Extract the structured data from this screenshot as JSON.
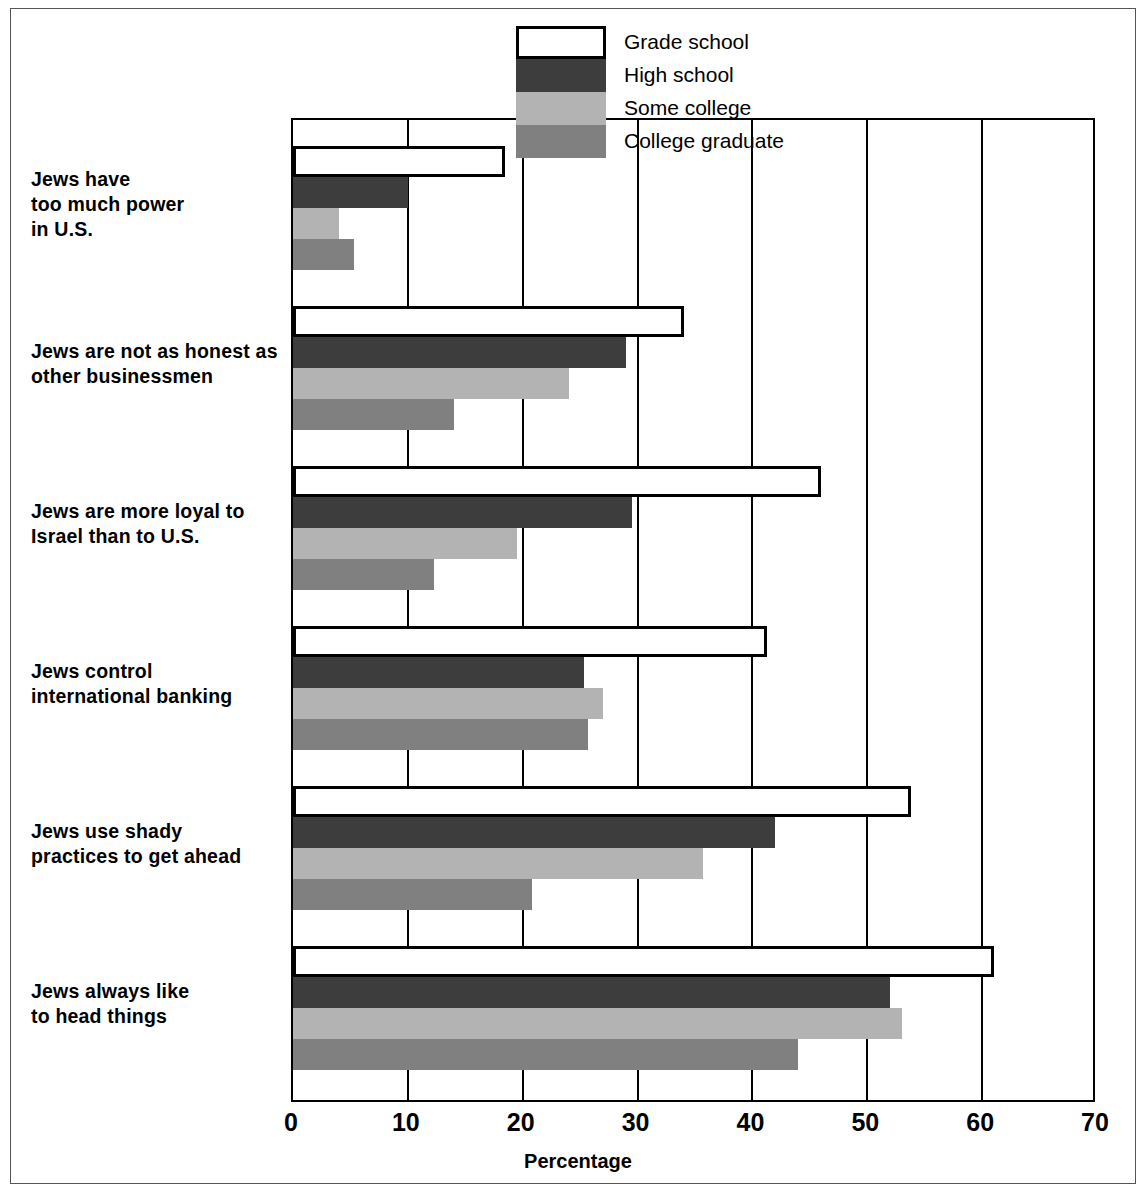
{
  "chart_data": {
    "type": "bar",
    "orientation": "horizontal",
    "title": "",
    "xlabel": "Percentage",
    "ylabel": "",
    "xlim": [
      0,
      70
    ],
    "xticks": [
      0,
      10,
      20,
      30,
      40,
      50,
      60,
      70
    ],
    "grid": true,
    "legend_position": "top-right",
    "categories": [
      "Jews have\ntoo much power\nin U.S.",
      "Jews are not as honest as\nother businessmen",
      "Jews are more loyal to\nIsrael than to U.S.",
      "Jews control\ninternational banking",
      "Jews use shady\npractices to get ahead",
      "Jews always like\nto head things"
    ],
    "series": [
      {
        "name": "Grade school",
        "color": "#ffffff",
        "values": [
          18.5,
          34.0,
          46.0,
          41.3,
          53.8,
          61.0
        ]
      },
      {
        "name": "High school",
        "color": "#3d3d3d",
        "values": [
          10.0,
          29.0,
          29.5,
          25.3,
          42.0,
          52.0
        ]
      },
      {
        "name": "Some college",
        "color": "#b3b3b3",
        "values": [
          4.0,
          24.0,
          19.5,
          27.0,
          35.7,
          53.0
        ]
      },
      {
        "name": "College graduate",
        "color": "#808080",
        "values": [
          5.3,
          14.0,
          12.3,
          25.7,
          20.8,
          44.0
        ]
      }
    ]
  },
  "legend": {
    "items": [
      {
        "label": "Grade school"
      },
      {
        "label": "High school"
      },
      {
        "label": "Some college"
      },
      {
        "label": "College graduate"
      }
    ]
  },
  "axis": {
    "x_title": "Percentage",
    "x_tick_labels": [
      "0",
      "10",
      "20",
      "30",
      "40",
      "50",
      "60",
      "70"
    ]
  },
  "categories": [
    {
      "lines": [
        "Jews have",
        "too much power",
        "in U.S."
      ]
    },
    {
      "lines": [
        "Jews are not as honest as",
        "other businessmen"
      ]
    },
    {
      "lines": [
        "Jews are more loyal to",
        "Israel than to U.S."
      ]
    },
    {
      "lines": [
        "Jews control",
        "international banking"
      ]
    },
    {
      "lines": [
        "Jews use shady",
        "practices to get ahead"
      ]
    },
    {
      "lines": [
        "Jews always like",
        "to head things"
      ]
    }
  ]
}
